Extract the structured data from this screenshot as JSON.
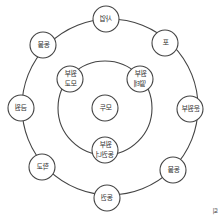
{
  "diagram": {
    "type": "concentric-ring-diagram",
    "center": {
      "label": "모두"
    },
    "inner_ring": [
      {
        "id": "inner-top-left",
        "lines": [
          "원부",
          "모교"
        ]
      },
      {
        "id": "inner-top-right",
        "lines": [
          "원부",
          "떨테"
        ]
      },
      {
        "id": "inner-bottom",
        "lines": [
          "원부",
          "동권너"
        ]
      }
    ],
    "outer_ring": [
      {
        "id": "outer-top",
        "lines": [
          "사업"
        ]
      },
      {
        "id": "outer-top-right",
        "lines": [
          "포"
        ]
      },
      {
        "id": "outer-right",
        "lines": [
          "운원부"
        ]
      },
      {
        "id": "outer-bottom-right",
        "lines": [
          "동물"
        ]
      },
      {
        "id": "outer-bottom",
        "lines": [
          "동권"
        ]
      },
      {
        "id": "outer-bottom-left",
        "lines": [
          "학교"
        ]
      },
      {
        "id": "outer-left",
        "lines": [
          "금원"
        ]
      },
      {
        "id": "outer-top-left",
        "lines": [
          "동물"
        ]
      }
    ],
    "corner_mark": "퇴"
  },
  "colors": {
    "stroke": "#444444",
    "text": "#333333",
    "background": "#ffffff"
  }
}
